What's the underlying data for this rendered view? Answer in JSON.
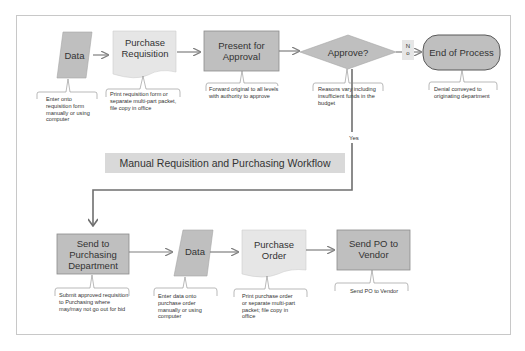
{
  "diagram": {
    "title": "Manual Requisition and Purchasing Workflow",
    "colors": {
      "shape_fill_light": "#e6e6e6",
      "shape_fill_dark": "#bfbfbf",
      "terminator_fill": "#bfbfbf",
      "connector": "#7f7f7f",
      "frame": "#c8c8c8",
      "title_fill": "#d9d9d9",
      "text": "#333333"
    },
    "nodes": [
      {
        "id": "data1",
        "type": "data",
        "label": "Data",
        "note": "Enter onto requisition form manually or using computer"
      },
      {
        "id": "purchase_requisition",
        "type": "document",
        "label": "Purchase Requisition",
        "note": "Print requisition form or separate multi-part packet, file copy in office"
      },
      {
        "id": "present_for_approval",
        "type": "process",
        "label": "Present for Approval",
        "note": "Forward original to all levels with authority to approve"
      },
      {
        "id": "approve",
        "type": "decision",
        "label": "Approve?",
        "note": "Reasons vary including insufficient funds in the budget"
      },
      {
        "id": "end_of_process",
        "type": "terminator",
        "label": "End of Process",
        "note": "Denial conveyed to originating department"
      },
      {
        "id": "send_to_purchasing",
        "type": "process",
        "label": "Send to Purchasing Department",
        "note": "Submit approved requisition to Purchasing where may/may not go out for bid"
      },
      {
        "id": "data2",
        "type": "data",
        "label": "Data",
        "note": "Enter data onto purchase order manually or using computer"
      },
      {
        "id": "purchase_order",
        "type": "document",
        "label": "Purchase Order",
        "note": "Print purchase order or separate multi-part packet; file copy in office"
      },
      {
        "id": "send_po_to_vendor",
        "type": "process",
        "label": "Send PO to Vendor",
        "note": "Send PO to Vendor"
      }
    ],
    "edges": [
      {
        "from": "data1",
        "to": "purchase_requisition",
        "label": ""
      },
      {
        "from": "purchase_requisition",
        "to": "present_for_approval",
        "label": ""
      },
      {
        "from": "present_for_approval",
        "to": "approve",
        "label": ""
      },
      {
        "from": "approve",
        "to": "end_of_process",
        "label": "No"
      },
      {
        "from": "approve",
        "to": "send_to_purchasing",
        "label": "Yes"
      },
      {
        "from": "send_to_purchasing",
        "to": "data2",
        "label": ""
      },
      {
        "from": "data2",
        "to": "purchase_order",
        "label": ""
      },
      {
        "from": "purchase_order",
        "to": "send_po_to_vendor",
        "label": ""
      }
    ],
    "no_label_top": "N",
    "no_label_bottom": "o"
  }
}
